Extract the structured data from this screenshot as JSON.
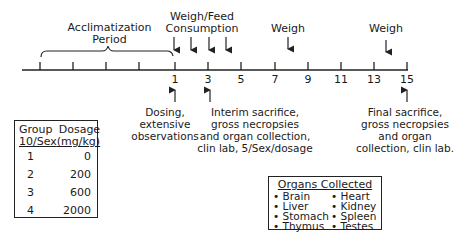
{
  "timeline": {
    "acclimatization_label_line1": "Acclimatization",
    "acclimatization_label_line2": "Period",
    "weigh_feed_line1": "Weigh/Feed",
    "weigh_feed_line2": "Consumption",
    "weigh_1": "Weigh",
    "weigh_2": "Weigh",
    "tick_labels": [
      "1",
      "3",
      "5",
      "7",
      "9",
      "11",
      "13",
      "15"
    ],
    "events": {
      "dosing_line1": "Dosing,",
      "dosing_line2": "extensive",
      "dosing_line3": "observations",
      "interim_line1": "Interim sacrifice,",
      "interim_line2": "gross necropsies",
      "interim_line3": "and organ collection,",
      "interim_line4": "clin lab, 5/Sex/dosage",
      "final_line1": "Final sacrifice,",
      "final_line2": "gross necropsies",
      "final_line3": "and organ",
      "final_line4": "collection, clin lab."
    }
  },
  "group_table": {
    "header_group_line1": "Group",
    "header_group_line2": "10/Sex",
    "header_dosage_line1": "Dosage",
    "header_dosage_line2": "(mg/kg)",
    "rows": [
      {
        "group": "1",
        "dosage": "0"
      },
      {
        "group": "2",
        "dosage": "200"
      },
      {
        "group": "3",
        "dosage": "600"
      },
      {
        "group": "4",
        "dosage": "2000"
      }
    ]
  },
  "organs": {
    "title": "Organs Collected",
    "items": [
      "Brain",
      "Heart",
      "Liver",
      "Kidney",
      "Stomach",
      "Spleen",
      "Thymus",
      "Testes"
    ]
  }
}
